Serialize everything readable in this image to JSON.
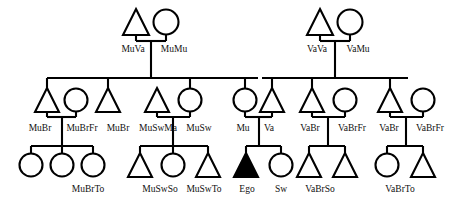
{
  "diagram": {
    "type": "pedigree",
    "colors": {
      "line": "#000000",
      "symbol_fill": "#ffffff",
      "ego_fill": "#000000",
      "background": "#ffffff",
      "label": "#111111"
    },
    "legend": {
      "triangle": "male",
      "circle": "female",
      "filled": "ego"
    }
  },
  "generations": {
    "g1": {
      "name": "grandparents",
      "couples": [
        {
          "id": "maternal-grandparents",
          "male": {
            "label": "MuVa",
            "shape": "triangle",
            "cx": 136,
            "cy": 22
          },
          "female": {
            "label": "MuMu",
            "shape": "circle",
            "cx": 166,
            "cy": 22
          }
        },
        {
          "id": "paternal-grandparents",
          "male": {
            "label": "VaVa",
            "shape": "triangle",
            "cx": 320,
            "cy": 22
          },
          "female": {
            "label": "VaMu",
            "shape": "circle",
            "cx": 350,
            "cy": 22
          }
        }
      ]
    },
    "g2": {
      "name": "parents-generation",
      "people": [
        {
          "label": "MuBr",
          "shape": "triangle",
          "cx": 38,
          "cy": 100
        },
        {
          "label": "MuBrFr",
          "shape": "circle",
          "cx": 72,
          "cy": 100
        },
        {
          "label": "MuBr",
          "shape": "triangle",
          "cx": 108,
          "cy": 100
        },
        {
          "label": "MuSwMa",
          "shape": "triangle",
          "cx": 152,
          "cy": 100
        },
        {
          "label": "MuSw",
          "shape": "circle",
          "cx": 190,
          "cy": 100
        },
        {
          "label": "Mu",
          "shape": "circle",
          "cx": 245,
          "cy": 100
        },
        {
          "label": "Va",
          "shape": "triangle",
          "cx": 272,
          "cy": 100
        },
        {
          "label": "VaBr",
          "shape": "triangle",
          "cx": 312,
          "cy": 100
        },
        {
          "label": "VaBrFr",
          "shape": "circle",
          "cx": 346,
          "cy": 100
        },
        {
          "label": "VaBr",
          "shape": "triangle",
          "cx": 390,
          "cy": 100
        },
        {
          "label": "VaBrFr",
          "shape": "circle",
          "cx": 424,
          "cy": 100
        }
      ]
    },
    "g3": {
      "name": "ego-generation",
      "people": [
        {
          "label": "",
          "shape": "circle",
          "cx": 32,
          "cy": 162,
          "group": "MuBrTo"
        },
        {
          "label": "",
          "shape": "circle",
          "cx": 63,
          "cy": 162,
          "group": "MuBrTo"
        },
        {
          "label": "",
          "shape": "circle",
          "cx": 94,
          "cy": 162,
          "group": "MuBrTo"
        },
        {
          "label": "",
          "shape": "triangle",
          "cx": 140,
          "cy": 162,
          "group": "MuSwSo"
        },
        {
          "label": "",
          "shape": "circle",
          "cx": 173,
          "cy": 162,
          "group": "MuSwTo"
        },
        {
          "label": "",
          "shape": "triangle",
          "cx": 208,
          "cy": 162,
          "group": "MuSwTo"
        },
        {
          "label": "Ego",
          "shape": "triangle",
          "cx": 248,
          "cy": 162,
          "filled": true
        },
        {
          "label": "Sw",
          "shape": "circle",
          "cx": 281,
          "cy": 162
        },
        {
          "label": "",
          "shape": "triangle",
          "cx": 309,
          "cy": 162,
          "group": "VaBrSo"
        },
        {
          "label": "",
          "shape": "triangle",
          "cx": 345,
          "cy": 162,
          "group": "VaBrSo"
        },
        {
          "label": "",
          "shape": "circle",
          "cx": 387,
          "cy": 162,
          "group": "VaBrTo"
        },
        {
          "label": "",
          "shape": "triangle",
          "cx": 423,
          "cy": 162,
          "group": "VaBrTo"
        }
      ]
    }
  },
  "labels": {
    "row_g1": [
      {
        "text": "MuVa",
        "x": 133,
        "y": 49
      },
      {
        "text": "MuMu",
        "x": 172,
        "y": 49
      },
      {
        "text": "VaVa",
        "x": 317,
        "y": 49
      },
      {
        "text": "VaMu",
        "x": 356,
        "y": 49
      }
    ],
    "row_g2": [
      {
        "text": "MuBr",
        "x": 39,
        "y": 127
      },
      {
        "text": "MuBrFr",
        "x": 79,
        "y": 127
      },
      {
        "text": "MuBr",
        "x": 115,
        "y": 127
      },
      {
        "text": "MuSwMa",
        "x": 155,
        "y": 127
      },
      {
        "text": "MuSw",
        "x": 197,
        "y": 127
      },
      {
        "text": "Mu",
        "x": 243,
        "y": 127
      },
      {
        "text": "Va",
        "x": 269,
        "y": 127
      },
      {
        "text": "VaBr",
        "x": 310,
        "y": 127
      },
      {
        "text": "VaBrFr",
        "x": 351,
        "y": 127
      },
      {
        "text": "VaBr",
        "x": 389,
        "y": 127
      },
      {
        "text": "VaBrFr",
        "x": 429,
        "y": 127
      }
    ],
    "row_g3": [
      {
        "text": "MuBrTo",
        "x": 88,
        "y": 189
      },
      {
        "text": "MuSwSo",
        "x": 160,
        "y": 189
      },
      {
        "text": "MuSwTo",
        "x": 203,
        "y": 189
      },
      {
        "text": "Ego",
        "x": 248,
        "y": 189
      },
      {
        "text": "Sw",
        "x": 281,
        "y": 189
      },
      {
        "text": "VaBrSo",
        "x": 318,
        "y": 189
      },
      {
        "text": "VaBrTo",
        "x": 397,
        "y": 189
      }
    ]
  },
  "links": {
    "marriage_bars": [
      {
        "id": "muva-mumu",
        "x1": 136,
        "x2": 166,
        "y": 38
      },
      {
        "id": "vava-vamu",
        "x1": 320,
        "x2": 350,
        "y": 38
      },
      {
        "id": "mubr-mubrfr",
        "x1": 38,
        "x2": 72,
        "y": 116
      },
      {
        "id": "muswma-musw",
        "x1": 152,
        "x2": 190,
        "y": 116
      },
      {
        "id": "mu-va",
        "x1": 245,
        "x2": 272,
        "y": 116
      },
      {
        "id": "vabr-vabrfr-1",
        "x1": 312,
        "x2": 346,
        "y": 116
      },
      {
        "id": "vabr-vabrfr-2",
        "x1": 390,
        "x2": 424,
        "y": 116
      }
    ],
    "sibling_bars": [
      {
        "id": "maternal-sibship",
        "x1": 48,
        "x2": 257,
        "y": 78
      },
      {
        "id": "paternal-sibship",
        "x1": 262,
        "x2": 407,
        "y": 78
      },
      {
        "id": "mubr-children",
        "x1": 32,
        "x2": 94,
        "y": 145
      },
      {
        "id": "musw-children",
        "x1": 140,
        "x2": 208,
        "y": 145
      },
      {
        "id": "ego-children",
        "x1": 248,
        "x2": 281,
        "y": 145
      },
      {
        "id": "vabr1-children",
        "x1": 309,
        "x2": 345,
        "y": 145
      },
      {
        "id": "vabr2-children",
        "x1": 387,
        "x2": 423,
        "y": 145
      }
    ]
  }
}
